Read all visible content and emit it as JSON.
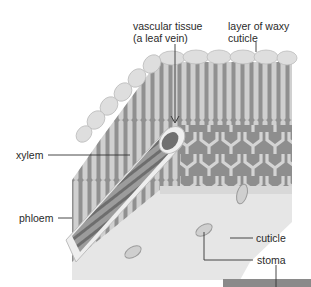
{
  "diagram": {
    "labels": {
      "vascular_tissue_line1": "vascular tissue",
      "vascular_tissue_line2": "(a leaf vein)",
      "waxy_cuticle_line1": "layer of waxy",
      "waxy_cuticle_line2": "cuticle",
      "xylem": "xylem",
      "phloem": "phloem",
      "cuticle": "cuticle",
      "stoma": "stoma"
    },
    "colors": {
      "background": "#ffffff",
      "epidermis": "#dcdcdc",
      "mesophyll_dark": "#8f8f8f",
      "mesophyll_light": "#d2d2d2",
      "lower_surface": "#e4e4e4",
      "label_text": "#2a2a2a",
      "leader_line": "#333333"
    }
  }
}
